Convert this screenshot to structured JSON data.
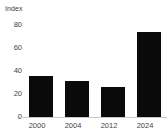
{
  "chart_data": {
    "type": "bar",
    "title": "",
    "subtitle": "",
    "xlabel": "",
    "ylabel": "Index",
    "categories": [
      "2000",
      "2004",
      "2012",
      "2024"
    ],
    "values": [
      36,
      31,
      26,
      74
    ],
    "series": [
      {
        "name": "Index",
        "values": [
          36,
          31,
          26,
          74
        ]
      }
    ],
    "ylim": [
      0,
      80
    ],
    "yticks": [
      0,
      20,
      40,
      60,
      80
    ],
    "ytick_labels": [
      "0",
      "20",
      "40",
      "60",
      "80"
    ],
    "xtick_labels": [
      "2000",
      "2004",
      "2012",
      "2024"
    ],
    "grid": false,
    "legend": false,
    "legend_position": "none",
    "annotations": [],
    "colors": {
      "bar": "#0a0a0a",
      "axis_line": "#c9c9c9",
      "tick_text": "#444444",
      "axis_title_text": "#3c3c3c",
      "background": "#ffffff"
    }
  }
}
